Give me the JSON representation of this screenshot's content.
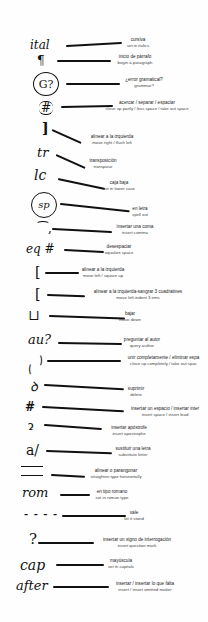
{
  "marks": [
    {
      "symbol": "ital",
      "es": "cursiva",
      "en": "set in italics"
    },
    {
      "symbol": "¶",
      "es": "inicio de párrafo",
      "en": "begin a paragraph"
    },
    {
      "symbol": "G?",
      "es": "¿error gramatical?",
      "en": "grammar?"
    },
    {
      "symbol": "#",
      "es": "acercar / separar / espaciar",
      "en": "close up partly / less space / take out space"
    },
    {
      "symbol": "]",
      "es": "alinear a la izquierda",
      "en": "move right / flush left"
    },
    {
      "symbol": "tr",
      "es": "transposición",
      "en": "transpose"
    },
    {
      "symbol": "lc",
      "es": "caja baja",
      "en": "set in lower case"
    },
    {
      "symbol": "sp",
      "es": "en letra",
      "en": "spell out"
    },
    {
      "symbol": "⁀,",
      "es": "insertar una coma",
      "en": "insert comma"
    },
    {
      "symbol": "eq #",
      "es": "desespaciar",
      "en": "equalize space"
    },
    {
      "symbol": "[",
      "es": "alinear a la izquierda",
      "en": "move left / square up"
    },
    {
      "symbol": "[",
      "es": "alinear a la izquierda-sangrar 3 cuadratines",
      "en": "move left-indent 3 ems"
    },
    {
      "symbol": "⊔",
      "es": "bajar",
      "en": "move down"
    },
    {
      "symbol": "au?",
      "es": "preguntar al autor",
      "en": "query author"
    },
    {
      "symbol": "⁀‿",
      "es": "unir completamente / eliminar espa",
      "en": "close up completely / take out spac"
    },
    {
      "symbol": "ꝺ",
      "es": "suprimir",
      "en": "delete"
    },
    {
      "symbol": "#",
      "es": "insertar un espacio / insertar inter",
      "en": "insert space / insert lead"
    },
    {
      "symbol": "ɂ",
      "es": "insertar apóstrofe",
      "en": "insert apostrophe"
    },
    {
      "symbol": "a/",
      "es": "sustituir una letra",
      "en": "substitute letter"
    },
    {
      "symbol": "=",
      "es": "alinear o parangonar",
      "en": "straighten type horizontally"
    },
    {
      "symbol": "rom",
      "es": "en tipo romano",
      "en": "set in roman type"
    },
    {
      "symbol": "- - - -",
      "es": "vale",
      "en": "let it stand"
    },
    {
      "symbol": "?",
      "es": "insertar un signo de interrogación",
      "en": "insert question mark"
    },
    {
      "symbol": "cap",
      "es": "mayúscula",
      "en": "set in capitals"
    },
    {
      "symbol": "after",
      "es": "insertar / insertar lo que falta",
      "en": "insert / insert omitted matter"
    }
  ]
}
